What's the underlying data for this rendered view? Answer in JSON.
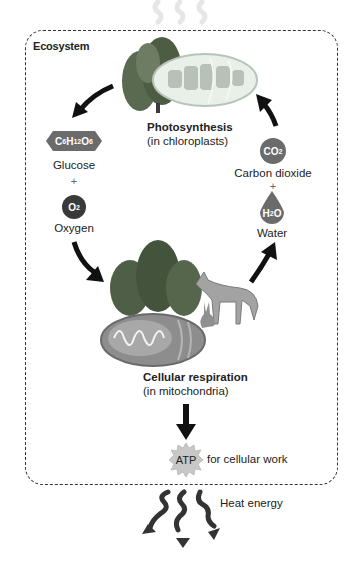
{
  "diagram": {
    "container_label": "Ecosystem",
    "photosynthesis": {
      "title": "Photosynthesis",
      "location": "(in chloroplasts)"
    },
    "cellular_respiration": {
      "title": "Cellular respiration",
      "location": "(in mitochondria)"
    },
    "outputs_left": {
      "glucose": {
        "formula_parts": [
          "C",
          "6",
          "H",
          "12",
          "O",
          "6"
        ],
        "label": "Glucose"
      },
      "plus": "+",
      "oxygen": {
        "formula_parts": [
          "O",
          "2"
        ],
        "label": "Oxygen"
      }
    },
    "inputs_right": {
      "co2": {
        "formula_parts": [
          "CO",
          "2"
        ],
        "label": "Carbon dioxide"
      },
      "plus": "+",
      "water": {
        "formula_parts": [
          "H",
          "2",
          "O"
        ],
        "label": "Water"
      }
    },
    "atp": {
      "label": "ATP",
      "caption": "for cellular work"
    },
    "heat": {
      "label": "Heat energy"
    },
    "icons": [
      "light-energy-icon",
      "trees-icon",
      "chloroplast-icon",
      "mitochondrion-icon",
      "coyote-icon",
      "rabbit-icon",
      "cycle-arrow-icon",
      "heat-wave-icon"
    ],
    "colors": {
      "molecule_fill": "#6b6b6b",
      "oxygen_fill": "#3a3a3a",
      "atp_fill": "#c8c8c8",
      "arrow": "#111111",
      "border": "#333333"
    }
  }
}
